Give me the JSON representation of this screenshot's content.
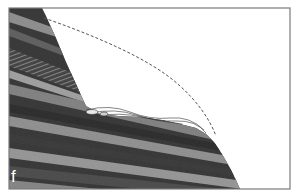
{
  "figure": {
    "panel_label": "f",
    "colors": {
      "frame": "#7a7a7a",
      "background": "#ffffff",
      "rock_dark": "#1a1a1a",
      "rock_mid": "#5a5a5a",
      "rock_light": "#a8a8a8",
      "profile_line": "#555555",
      "label": "#ffffff"
    },
    "elements": {
      "former_profile": "dashed curve",
      "rock_mass": "layered strata",
      "debris": "talus deposit at slope foot"
    }
  }
}
